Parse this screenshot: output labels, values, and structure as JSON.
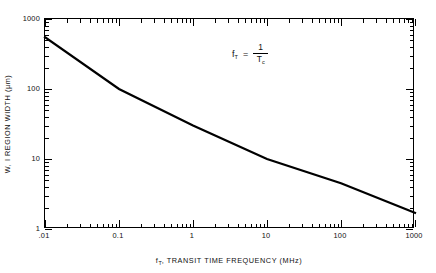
{
  "chart_data": {
    "type": "line",
    "title": "",
    "subtitle": "",
    "xlabel": "f_T , TRANSIT TIME FREQUENCY (MHz)",
    "xlabel_symbol": "f",
    "xlabel_symbol_sub": "T",
    "xlabel_rest": ", TRANSIT TIME FREQUENCY (MHz)",
    "ylabel": "W, I REGION WIDTH (µm)",
    "xscale": "log",
    "yscale": "log",
    "xlim": [
      0.01,
      1000
    ],
    "ylim": [
      1,
      1000
    ],
    "grid": false,
    "legend": null,
    "xticks": [
      0.01,
      0.1,
      1,
      10,
      100,
      1000
    ],
    "xticklabels": [
      ".01",
      "0.1",
      "1",
      "10",
      "100",
      "1000"
    ],
    "yticks": [
      1,
      10,
      100,
      1000
    ],
    "yticklabels": [
      "1",
      "10",
      "100",
      "1000"
    ],
    "minor_ticks": true,
    "tick_direction": "in",
    "frame": "box",
    "series": [
      {
        "name": "W vs f_T",
        "color": "#000000",
        "linewidth": 2.2,
        "x": [
          0.01,
          0.1,
          1,
          10,
          100,
          1000
        ],
        "y": [
          550,
          100,
          30,
          10,
          4.5,
          1.7
        ]
      }
    ],
    "annotations": [
      {
        "name": "transit-frequency-equation",
        "text": "f_T = 1 / T_c",
        "lhs": "f",
        "lhs_sub": "T",
        "operator": "=",
        "numerator": "1",
        "denominator": "T",
        "denominator_sub": "c",
        "x": 0.9,
        "y": 330
      }
    ]
  },
  "axes": {
    "x_tick_labels": [
      ".01",
      "0.1",
      "1",
      "10",
      "100",
      "1000"
    ],
    "y_tick_labels": [
      "1000",
      "100",
      "10",
      "1"
    ]
  }
}
